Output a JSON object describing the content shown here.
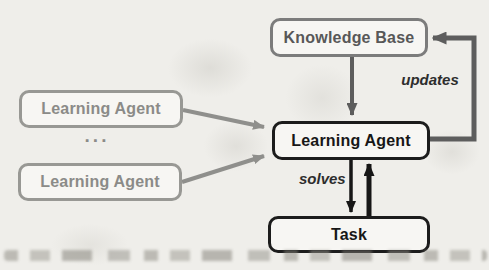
{
  "diagram": {
    "nodes": {
      "knowledge_base": {
        "label": "Knowledge Base"
      },
      "learning_agent": {
        "label": "Learning Agent"
      },
      "task": {
        "label": "Task"
      },
      "learning_agent_top": {
        "label": "Learning Agent"
      },
      "learning_agent_bottom": {
        "label": "Learning Agent"
      }
    },
    "ellipsis": "...",
    "edge_labels": {
      "updates": "updates",
      "solves": "solves"
    },
    "edges": [
      {
        "from": "Knowledge Base",
        "to": "Learning Agent",
        "label": "",
        "style": "gray"
      },
      {
        "from": "Learning Agent",
        "to": "Knowledge Base",
        "label": "updates",
        "style": "gray-loop"
      },
      {
        "from": "Learning Agent",
        "to": "Task",
        "label": "solves",
        "style": "black"
      },
      {
        "from": "Task",
        "to": "Learning Agent",
        "label": "",
        "style": "black"
      },
      {
        "from": "Learning Agent (left top)",
        "to": "Learning Agent",
        "label": "",
        "style": "light-gray"
      },
      {
        "from": "Learning Agent (left bottom)",
        "to": "Learning Agent",
        "label": "",
        "style": "light-gray"
      }
    ]
  },
  "colors": {
    "bg": "#efeeea",
    "node-bg": "#f7f6f3",
    "dark-border": "#1c1c1c",
    "dark-text": "#171717",
    "gray-border": "#7c7c7c",
    "gray-text": "#585858",
    "light-border": "#989894",
    "light-text": "#8b8b88",
    "arrow-dark": "#5d5d5d",
    "arrow-light": "#8f8f8c",
    "arrow-black": "#161616",
    "label-text": "#2d2d2d"
  }
}
